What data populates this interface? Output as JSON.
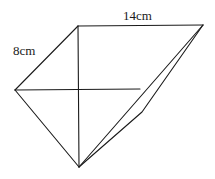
{
  "diagram": {
    "type": "geometry-figure",
    "labels": {
      "top_edge": "14cm",
      "left_edge": "8cm"
    },
    "vertices": {
      "top_left": [
        78,
        26
      ],
      "top_right": [
        203,
        25
      ],
      "left": [
        15,
        90
      ],
      "bottom": [
        79,
        167
      ],
      "mid_right": [
        140,
        89
      ],
      "kink": [
        142,
        112
      ]
    },
    "stroke_color": "#1a1a1a",
    "background_color": "#ffffff"
  }
}
